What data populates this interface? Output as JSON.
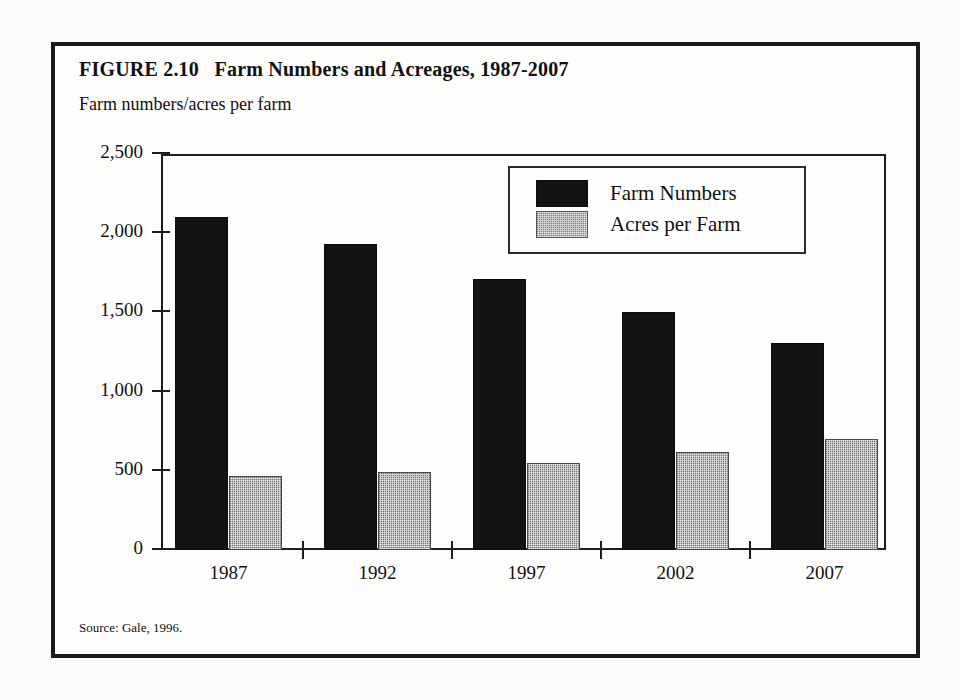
{
  "figure": {
    "title": "FIGURE 2.10   Farm Numbers and Acreages, 1987-2007",
    "axis_caption": "Farm numbers/acres per farm",
    "source": "Source: Gale, 1996."
  },
  "legend": {
    "items": [
      {
        "label": "Farm Numbers",
        "swatch": "black-swatch"
      },
      {
        "label": "Acres per Farm",
        "swatch": "gray-stipple-swatch"
      }
    ]
  },
  "colors": {
    "farm_numbers": "#131313",
    "acres_per_farm": "#a9a9a9",
    "frame": "#1a1a1a",
    "background": "#fdfdfc"
  },
  "chart_data": {
    "type": "bar",
    "title": "FIGURE 2.10   Farm Numbers and Acreages, 1987-2007",
    "subtitle": "Farm numbers/acres per farm",
    "xlabel": "",
    "ylabel": "Farm numbers/acres per farm",
    "categories": [
      "1987",
      "1992",
      "1997",
      "2002",
      "2007"
    ],
    "series": [
      {
        "name": "Farm Numbers",
        "values": [
          2100,
          1935,
          1710,
          1505,
          1305
        ]
      },
      {
        "name": "Acres per Farm",
        "values": [
          465,
          490,
          550,
          620,
          700
        ]
      }
    ],
    "ylim": [
      0,
      2500
    ],
    "yticks": [
      0,
      500,
      1000,
      1500,
      2000,
      2500
    ],
    "ytick_labels": [
      "0",
      "500",
      "1,000",
      "1,500",
      "2,000",
      "2,500"
    ],
    "grid": false,
    "legend_position": "upper-right-inside",
    "annotations": [
      "Source: Gale, 1996."
    ]
  }
}
